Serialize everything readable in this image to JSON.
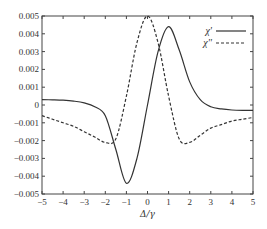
{
  "chart_data": {
    "type": "line",
    "title": "",
    "xlabel": "Δ/γ",
    "ylabel": "",
    "xlim": [
      -5,
      5
    ],
    "ylim": [
      -0.005,
      0.005
    ],
    "grid": false,
    "legend_position": "top-right",
    "x_ticks": [
      "-5",
      "-4",
      "-3",
      "-2",
      "-1",
      "0",
      "1",
      "2",
      "3",
      "4",
      "5"
    ],
    "y_ticks": [
      "0.005",
      "0.004",
      "0.003",
      "0.002",
      "0.001",
      "0",
      "-0.001",
      "-0.002",
      "-0.003",
      "-0.004",
      "-0.005"
    ],
    "x": [
      -5,
      -4.5,
      -4,
      -3.5,
      -3,
      -2.5,
      -2,
      -1.5,
      -1,
      -0.5,
      0,
      0.5,
      1,
      1.5,
      2,
      2.5,
      3,
      3.5,
      4,
      4.5,
      5
    ],
    "series": [
      {
        "name": "χ'",
        "style": "solid",
        "color": "#333333",
        "values": [
          0.0003,
          0.00029,
          0.00027,
          0.00022,
          0.00012,
          -0.0001,
          -0.0006,
          -0.0025,
          -0.0044,
          -0.003,
          0.0,
          0.003,
          0.0044,
          0.0031,
          0.0013,
          0.0003,
          -0.0001,
          -0.00022,
          -0.00028,
          -0.0003,
          -0.0003
        ]
      },
      {
        "name": "χ''",
        "style": "dashed",
        "color": "#333333",
        "values": [
          -0.0006,
          -0.0008,
          -0.001,
          -0.0012,
          -0.0015,
          -0.0018,
          -0.0021,
          -0.0019,
          0.0005,
          0.0035,
          0.005,
          0.0035,
          0.0005,
          -0.0019,
          -0.0021,
          -0.0017,
          -0.0013,
          -0.0011,
          -0.0009,
          -0.0008,
          -0.0007
        ]
      }
    ]
  }
}
